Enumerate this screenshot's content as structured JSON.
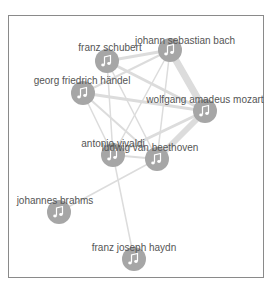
{
  "graph": {
    "node_color": "#a6a6a6",
    "edge_color": "#dcdcdc",
    "label_color": "#555555",
    "nodes": [
      {
        "id": "schubert",
        "label": "franz schubert",
        "x": 107,
        "y": 61,
        "lx": 110,
        "ly": 51
      },
      {
        "id": "bach",
        "label": "johann sebastian bach",
        "x": 170,
        "y": 50,
        "lx": 185,
        "ly": 44
      },
      {
        "id": "handel",
        "label": "georg friedrich händel",
        "x": 83,
        "y": 93,
        "lx": 82,
        "ly": 84
      },
      {
        "id": "mozart",
        "label": "wolfgang amadeus mozart",
        "x": 205,
        "y": 111,
        "lx": 205,
        "ly": 103
      },
      {
        "id": "vivaldi",
        "label": "antonio vivaldi",
        "x": 113,
        "y": 155,
        "lx": 113,
        "ly": 147
      },
      {
        "id": "beethoven",
        "label": "ludwig van beethoven",
        "x": 157,
        "y": 159,
        "lx": 150,
        "ly": 151
      },
      {
        "id": "brahms",
        "label": "johannes brahms",
        "x": 59,
        "y": 212,
        "lx": 55,
        "ly": 204
      },
      {
        "id": "haydn",
        "label": "franz joseph haydn",
        "x": 134,
        "y": 259,
        "lx": 134,
        "ly": 251
      }
    ],
    "edges": [
      {
        "s": "bach",
        "t": "mozart",
        "w": 7
      },
      {
        "s": "mozart",
        "t": "beethoven",
        "w": 6
      },
      {
        "s": "schubert",
        "t": "bach",
        "w": 3
      },
      {
        "s": "schubert",
        "t": "mozart",
        "w": 3
      },
      {
        "s": "handel",
        "t": "bach",
        "w": 2
      },
      {
        "s": "handel",
        "t": "mozart",
        "w": 3
      },
      {
        "s": "handel",
        "t": "beethoven",
        "w": 2
      },
      {
        "s": "handel",
        "t": "vivaldi",
        "w": 1.5
      },
      {
        "s": "schubert",
        "t": "vivaldi",
        "w": 1.5
      },
      {
        "s": "schubert",
        "t": "beethoven",
        "w": 1.5
      },
      {
        "s": "bach",
        "t": "vivaldi",
        "w": 1.5
      },
      {
        "s": "bach",
        "t": "beethoven",
        "w": 1.5
      },
      {
        "s": "vivaldi",
        "t": "mozart",
        "w": 3
      },
      {
        "s": "vivaldi",
        "t": "beethoven",
        "w": 2
      },
      {
        "s": "beethoven",
        "t": "brahms",
        "w": 1.5
      },
      {
        "s": "vivaldi",
        "t": "haydn",
        "w": 1.5
      }
    ]
  }
}
